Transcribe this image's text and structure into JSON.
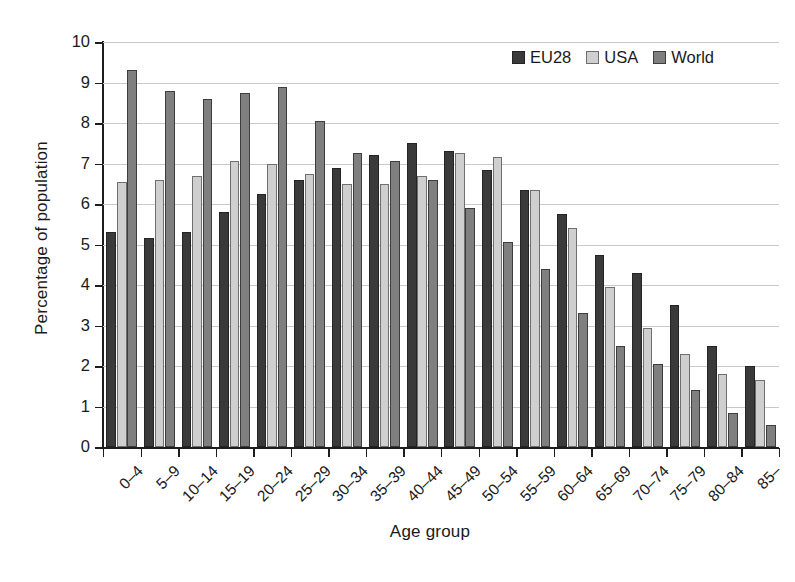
{
  "chart_data": {
    "type": "bar",
    "title": "",
    "xlabel": "Age group",
    "ylabel": "Percentage of population",
    "ylim": [
      0,
      10
    ],
    "ytick_step": 1,
    "yticks": [
      "10",
      "9",
      "8",
      "7",
      "6",
      "5",
      "4",
      "3",
      "2",
      "1",
      "0"
    ],
    "grid": true,
    "legend_position": "top-right",
    "categories": [
      "0–4",
      "5–9",
      "10–14",
      "15–19",
      "20–24",
      "25–29",
      "30–34",
      "35–39",
      "40–44",
      "45–49",
      "50–54",
      "55–59",
      "60–64",
      "65–69",
      "70–74",
      "75–79",
      "80–84",
      "85–"
    ],
    "series": [
      {
        "name": "EU28",
        "color": "#3a3a3a",
        "values": [
          5.3,
          5.15,
          5.3,
          5.8,
          6.25,
          6.6,
          6.9,
          7.2,
          7.5,
          7.3,
          6.85,
          6.35,
          5.75,
          4.75,
          4.3,
          3.5,
          2.5,
          2.0
        ]
      },
      {
        "name": "USA",
        "color": "#cfcfcf",
        "values": [
          6.55,
          6.6,
          6.7,
          7.05,
          7.0,
          6.75,
          6.5,
          6.5,
          6.7,
          7.25,
          7.15,
          6.35,
          5.4,
          3.95,
          2.95,
          2.3,
          1.8,
          1.65
        ]
      },
      {
        "name": "World",
        "color": "#7f7f7f",
        "values": [
          9.3,
          8.8,
          8.6,
          8.75,
          8.9,
          8.05,
          7.25,
          7.05,
          6.6,
          5.9,
          5.05,
          4.4,
          3.3,
          2.5,
          2.05,
          1.4,
          0.85,
          0.55
        ]
      }
    ]
  },
  "legend": {
    "items": [
      {
        "label": "EU28"
      },
      {
        "label": "USA"
      },
      {
        "label": "World"
      }
    ]
  }
}
